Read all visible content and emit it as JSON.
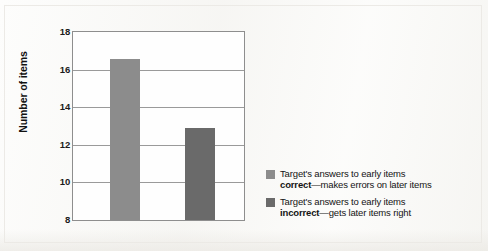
{
  "chart_data": {
    "type": "bar",
    "title": "",
    "subtitle": "",
    "xlabel": "",
    "ylabel": "Number of items",
    "ylim": [
      8,
      18
    ],
    "ytick_values": [
      18,
      16,
      14,
      12,
      10,
      8
    ],
    "ytick_labels": [
      "18",
      "16",
      "14",
      "12",
      "10",
      "8"
    ],
    "grid": "horizontal",
    "xtick_labels": [],
    "legend_position": "right",
    "categories": [
      "Target's answers to early items correct—makes errors on later items",
      "Target's answers to early items incorrect—gets later items right"
    ],
    "values": [
      16.55,
      12.9
    ],
    "bar_colors": [
      "#8c8c8c",
      "#6a6a6a"
    ],
    "bars": [
      {
        "label": "correct-early-items",
        "value": 16.55,
        "color": "#8c8c8c"
      },
      {
        "label": "incorrect-early-items",
        "value": 12.9,
        "color": "#6a6a6a"
      }
    ]
  },
  "axis": {
    "y_title": "Number of items",
    "ticks": [
      {
        "label": "18",
        "value": 18
      },
      {
        "label": "16",
        "value": 16
      },
      {
        "label": "14",
        "value": 14
      },
      {
        "label": "12",
        "value": 12
      },
      {
        "label": "10",
        "value": 10
      },
      {
        "label": "8",
        "value": 8
      }
    ]
  },
  "legend": {
    "entries": [
      {
        "swatch_color": "#8c8c8c",
        "line1": "Target's answers to early items",
        "emphasis": "correct",
        "line2_rest": "—makes errors on later items"
      },
      {
        "swatch_color": "#6a6a6a",
        "line1": "Target's answers to early items",
        "emphasis": "incorrect",
        "line2_rest": "—gets later items right"
      }
    ]
  }
}
